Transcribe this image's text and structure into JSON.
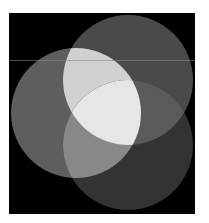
{
  "diagram": {
    "type": "three-circle-venn",
    "background": "#ffffff",
    "frame": {
      "x": 9,
      "y": 13,
      "width": 186,
      "height": 201,
      "color": "#000000"
    },
    "circles": [
      {
        "id": "left",
        "cx": 76,
        "cy": 113,
        "r": 65,
        "color": "#5e5e5e"
      },
      {
        "id": "top",
        "cx": 128,
        "cy": 80,
        "r": 65,
        "color": "#4a4a4a"
      },
      {
        "id": "bottom",
        "cx": 128,
        "cy": 145,
        "r": 65,
        "color": "#333333"
      }
    ],
    "intersections": {
      "left_top": "#d0d0d0",
      "left_bottom": "#888888",
      "top_bottom": "#5a5a5a",
      "all": "#e6e6e6"
    },
    "scanline": {
      "y": 60,
      "color": "#8a8a8a"
    }
  }
}
